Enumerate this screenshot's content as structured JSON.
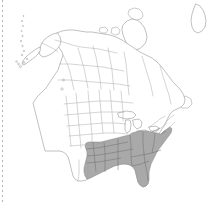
{
  "figure": {
    "kind": "distribution-range-map",
    "region": "North America",
    "title": "",
    "caption": "",
    "width_px": 217,
    "height_px": 204
  },
  "legend": {
    "shaded_meaning": "Species present / range",
    "unshaded_meaning": "Species absent",
    "visible": false
  },
  "colors": {
    "background": "#ffffff",
    "shaded_fill": "#a9a9a9",
    "unshaded_fill": "#ffffff",
    "coastline_stroke": "#8d8d8d",
    "subdivision_stroke": "#a0a0a0",
    "shaded_subdivision_stroke": "#6e6e6e",
    "margin_rule": "#b4b4b4"
  },
  "margin_rule": {
    "name": "dotted-left-margin",
    "orientation": "vertical",
    "position": "left-edge",
    "style": "dotted"
  },
  "map_features": {
    "countries_outlined": [
      "Canada",
      "United States",
      "Mexico",
      "Greenland (partial)"
    ],
    "shaded_area_label": "Southeastern United States",
    "shaded_states": [
      "Texas (east)",
      "Oklahoma (east)",
      "Arkansas",
      "Louisiana",
      "Mississippi",
      "Alabama",
      "Georgia",
      "Florida",
      "South Carolina",
      "North Carolina",
      "Tennessee",
      "Kentucky",
      "Virginia",
      "West Virginia",
      "Maryland",
      "Delaware",
      "Missouri (south)",
      "Ohio (south)",
      "Pennsylvania (southeast)",
      "New Jersey"
    ],
    "unshaded_regions": [
      "Alaska",
      "Canada",
      "Pacific Northwest",
      "Great Plains",
      "Rocky Mountains",
      "Southwest",
      "New England",
      "Upper Midwest"
    ]
  },
  "geometry": {
    "mainland_outline": "M 38.5 37.2 L 41.8 33.0 L 45.0 31.5 L 47.0 33.5 L 49.5 31.0 L 52.0 32.5 L 54.5 30.0 L 57.0 28.0 L 59.5 26.5 L 62.0 25.0 L 63.0 22.0 L 64.5 20.0 L 67.5 20.5 L 69.0 23.0 L 71.5 22.0 L 74.0 20.5 L 77.0 21.5 L 79.5 20.0 L 82.0 18.5 L 84.5 19.5 L 86.5 21.5 L 89.0 20.0 L 91.5 18.0 L 94.0 17.0 L 96.5 18.5 L 99.0 17.0 L 101.5 18.5 L 104.0 20.0 L 106.5 19.0 L 109.0 17.5 L 111.5 16.0 L 114.0 17.0 L 116.5 19.0 L 119.0 20.5 L 121.5 19.0 L 124.0 17.5 L 126.5 19.0 L 129.0 21.0 L 131.5 23.0 L 134.0 22.0 L 136.5 20.5 L 139.0 22.5 L 141.5 25.0 L 144.0 27.0 L 146.5 29.5 L 149.0 31.5 L 151.5 33.0 L 154.0 35.5 L 156.0 38.5 L 158.0 41.5 L 160.0 44.5 L 162.0 47.5 L 164.5 50.0 L 167.0 53.0 L 169.0 56.5 L 171.0 60.0 L 172.5 63.5 L 174.0 67.0 L 175.5 70.5 L 177.0 74.0 L 178.5 77.5 L 180.0 81.0 L 181.5 84.5 L 183.0 88.0 L 184.0 91.5 L 185.0 95.0 L 186.0 98.5 L 186.5 102.0 L 187.0 105.5 L 186.0 109.0 L 184.5 112.0 L 182.5 114.5 L 180.0 116.5 L 177.5 118.0 L 175.0 120.0 L 173.0 122.5 L 171.5 125.5 L 170.0 128.5 L 168.5 131.5 L 167.0 134.5 L 166.0 138.0 L 165.0 141.5 L 164.0 145.0 L 163.0 148.5 L 162.0 152.0 L 161.0 155.5 L 160.0 159.0 L 158.5 162.0 L 157.0 165.0 L 156.0 168.5 L 155.5 172.0 L 155.0 175.5 L 154.0 179.0 L 152.5 182.0 L 150.5 184.5 L 148.0 186.0 L 145.5 185.0 L 143.5 183.0 L 142.0 180.0 L 141.0 176.5 L 140.0 173.0 L 138.5 170.0 L 136.5 168.0 L 134.0 167.0 L 131.5 166.5 L 129.0 167.0 L 126.5 168.0 L 124.0 169.5 L 121.5 171.0 L 119.0 172.5 L 116.5 174.0 L 114.0 175.5 L 111.5 177.0 L 109.0 178.5 L 106.5 180.0 L 104.0 181.0 L 101.5 180.0 L 99.5 178.0 L 98.0 175.0 L 97.0 171.5 L 96.5 168.0 L 96.0 164.5 L 95.0 161.0 L 93.5 158.0 L 91.5 156.0 L 89.0 155.0 L 86.5 154.5 L 84.0 154.0 L 81.5 153.5 L 79.0 153.0 L 76.5 152.5 L 74.0 152.0 L 71.5 151.5 L 69.0 151.0 L 66.5 150.5 L 64.0 150.0 L 61.5 149.5 L 59.0 149.0 L 58.0 145.5 L 57.0 142.0 L 56.0 138.5 L 55.0 135.0 L 54.0 131.5 L 53.5 128.0 L 53.0 124.5 L 52.5 121.0 L 52.0 117.5 L 51.5 114.0 L 51.0 110.5 L 50.5 107.0 L 50.0 103.5 L 49.5 100.0 L 49.0 96.5 L 48.5 93.0 L 48.0 89.5 L 47.5 86.0 L 47.0 82.5 L 46.5 79.0 L 46.0 75.5 L 45.5 72.0 L 45.0 68.5 L 44.5 65.0 L 44.0 61.5 L 43.5 58.0 L 43.0 54.5 L 42.0 51.0 L 40.5 47.5 L 39.5 44.0 L 38.5 40.5 Z",
    "note": "Outline paths are rendered as inline SVG in the template."
  }
}
